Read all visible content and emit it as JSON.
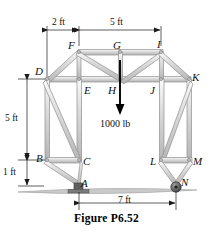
{
  "figure": {
    "caption": "Figure P6.52",
    "load": {
      "label": "1000 lb",
      "magnitude": 1000,
      "unit": "lb",
      "direction": "down",
      "applied_at": "H"
    },
    "dimensions": [
      {
        "id": "top-left-span",
        "label": "2 ft",
        "value": 2,
        "unit": "ft",
        "orientation": "horizontal"
      },
      {
        "id": "top-right-span",
        "label": "5 ft",
        "value": 5,
        "unit": "ft",
        "orientation": "horizontal"
      },
      {
        "id": "left-height",
        "label": "5 ft",
        "value": 5,
        "unit": "ft",
        "orientation": "vertical"
      },
      {
        "id": "base-height",
        "label": "1 ft",
        "value": 1,
        "unit": "ft",
        "orientation": "vertical"
      },
      {
        "id": "base-span",
        "label": "7 ft",
        "value": 7,
        "unit": "ft",
        "orientation": "horizontal"
      }
    ],
    "nodes": [
      {
        "id": "A",
        "label": "A",
        "x": 79,
        "y": 183,
        "support": "pin"
      },
      {
        "id": "B",
        "label": "B",
        "x": 47,
        "y": 160,
        "support": "none"
      },
      {
        "id": "C",
        "label": "C",
        "x": 79,
        "y": 160,
        "support": "none"
      },
      {
        "id": "D",
        "label": "D",
        "x": 47,
        "y": 79,
        "support": "none"
      },
      {
        "id": "E",
        "label": "E",
        "x": 79,
        "y": 79,
        "support": "none"
      },
      {
        "id": "F",
        "label": "F",
        "x": 79,
        "y": 52,
        "support": "none"
      },
      {
        "id": "G",
        "label": "G",
        "x": 120,
        "y": 52,
        "support": "none"
      },
      {
        "id": "H",
        "label": "H",
        "x": 120,
        "y": 79,
        "support": "none"
      },
      {
        "id": "I",
        "label": "I",
        "x": 161,
        "y": 52,
        "support": "none"
      },
      {
        "id": "J",
        "label": "J",
        "x": 161,
        "y": 79,
        "support": "none"
      },
      {
        "id": "K",
        "label": "K",
        "x": 189,
        "y": 79,
        "support": "none"
      },
      {
        "id": "L",
        "label": "L",
        "x": 161,
        "y": 160,
        "support": "none"
      },
      {
        "id": "M",
        "label": "M",
        "x": 189,
        "y": 160,
        "support": "none"
      },
      {
        "id": "N",
        "label": "N",
        "x": 175,
        "y": 183,
        "support": "roller"
      }
    ],
    "members": [
      {
        "from": "F",
        "to": "G"
      },
      {
        "from": "G",
        "to": "I"
      },
      {
        "from": "D",
        "to": "E"
      },
      {
        "from": "E",
        "to": "H"
      },
      {
        "from": "H",
        "to": "J"
      },
      {
        "from": "J",
        "to": "K"
      },
      {
        "from": "D",
        "to": "F"
      },
      {
        "from": "F",
        "to": "E"
      },
      {
        "from": "F",
        "to": "H"
      },
      {
        "from": "G",
        "to": "H"
      },
      {
        "from": "H",
        "to": "I"
      },
      {
        "from": "I",
        "to": "J"
      },
      {
        "from": "I",
        "to": "K"
      },
      {
        "from": "D",
        "to": "B"
      },
      {
        "from": "E",
        "to": "C"
      },
      {
        "from": "D",
        "to": "C"
      },
      {
        "from": "B",
        "to": "C"
      },
      {
        "from": "B",
        "to": "A"
      },
      {
        "from": "C",
        "to": "A"
      },
      {
        "from": "J",
        "to": "L"
      },
      {
        "from": "K",
        "to": "M"
      },
      {
        "from": "L",
        "to": "K"
      },
      {
        "from": "L",
        "to": "M"
      },
      {
        "from": "L",
        "to": "N"
      },
      {
        "from": "M",
        "to": "N"
      }
    ],
    "colors": {
      "member_fill": "#d9d9d9",
      "member_edge": "#8a8a8a",
      "ground": "#b3b3b3",
      "support_block": "#6e6e6e",
      "dimension_line": "#1a1a1a",
      "load_arrow": "#000000",
      "label_text": "#111111"
    }
  }
}
